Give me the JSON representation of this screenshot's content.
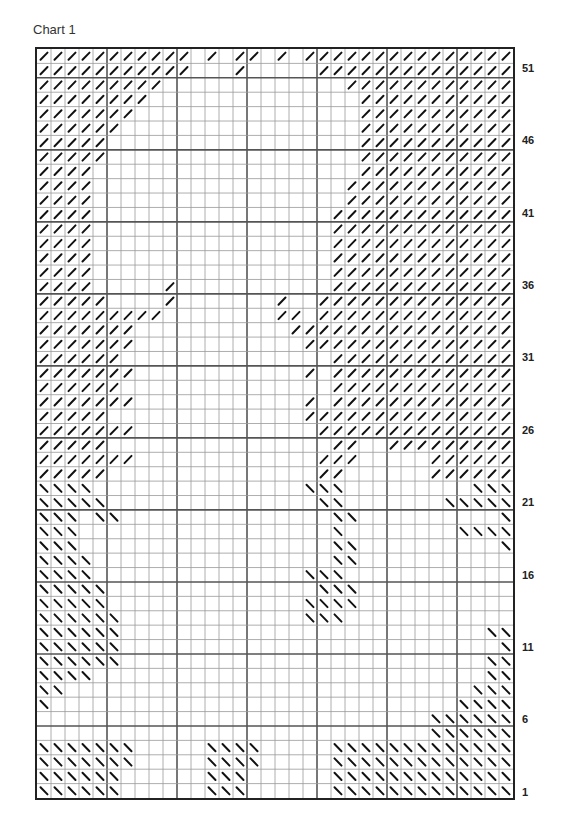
{
  "title": "Chart 1",
  "legend_symbols": {
    "f": "forward-slash stitch",
    "b": "back-slash stitch",
    ".": "empty"
  },
  "chart_data": {
    "type": "table",
    "title": "Chart 1",
    "columns": 34,
    "rows": 52,
    "row_labels": [
      51,
      46,
      41,
      36,
      31,
      26,
      21,
      16,
      11,
      6,
      1
    ],
    "grid_rows_top_to_bottom": [
      "fffffffffff.f.ff.f.fffffffffffffff",
      "fffffffffff...f.....ffffffffffffff",
      "fffffffff.............ffffffffffff",
      "ffffffff...............fffffffffff",
      "fffffff................fffffffffff",
      "ffffff.................fffffffffff",
      "fffff..................fffffffffff",
      "fffff..................fffffffffff",
      "ffff...................fffffffffff",
      "ffff..................ffffffffffff",
      "ffff..................ffffffffffff",
      "ffff.................fffffffffffff",
      "ffff.................fffffffffffff",
      "ffff.................fffffffffffff",
      "ffff.................fffffffffffff",
      "ffff.................fffffffffffff",
      "ffff.....f...........fffffffffffff",
      "fffff....f.......f..ffffffffffffff",
      "fffffffff........ff.ffffffffffffff",
      "fffffff...........ffffffffffffffff",
      "fffffff............fffffffffffffff",
      "ffffff...............fffffffffffff",
      "fffffff............f.fffffffffffff",
      "ffffff...............fffffffffffff",
      "fffffff............f.fffffffffffff",
      "fffff..............ffffffffffffffff",
      "fffffff.............ffffffffffffff",
      "fffff................ff..fffffffff",
      "fffffff.............fff.....ffffff",
      "fffff...............ff......ffffff",
      "bbbb...............bbb.........bbb",
      "bbbbb...............bb.......bbbbb",
      "bbb.bb...............bb..........b",
      "bbb..................b........bbbb",
      "bbb..................bb..........b",
      "bbbb.................bb...........",
      "bbbb...............bbb............",
      "bbbbb...............bbb...........",
      "bbbbb..............bbbb...........",
      "bbbbbb.............bbb............",
      "bbbbbb..........................bb",
      "bbbbbb...........................b",
      "bbbbbb..........................bb",
      "bbbb............................bb",
      "bb.............................bbb",
      "b.............................bbbb",
      "............................bbbbbb",
      "............................bbbbbb",
      "bbbbbbb.....bbbb.....bbbbbbbbbbbbb",
      "bbbbbbb.....bbbb.....bbbbbbbbbbbbb",
      "bbbbbb......bbb......bbbbbbbbbbbbb",
      "bbbbbb......bbb......bbbbbbbbbbbbb"
    ]
  }
}
